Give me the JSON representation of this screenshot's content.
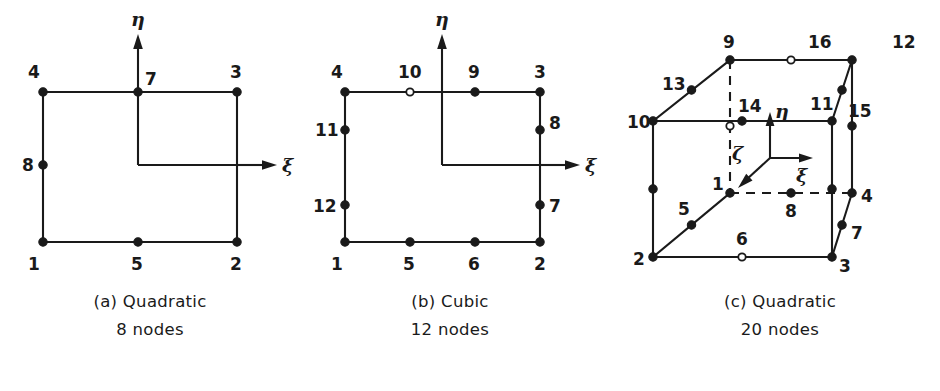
{
  "figure": {
    "panels": [
      {
        "id": "a",
        "caption_line1": "(a) Quadratic",
        "caption_line2": "8 nodes",
        "element_type": "Quadratic",
        "node_count": 8,
        "dimension": "2D",
        "axes": [
          {
            "name": "xi",
            "label": "ξ",
            "direction": "right"
          },
          {
            "name": "eta",
            "label": "η",
            "direction": "up"
          }
        ],
        "nodes": [
          {
            "id": "1",
            "label": "1",
            "marker": "filled",
            "position": "bottom-left-corner"
          },
          {
            "id": "2",
            "label": "2",
            "marker": "filled",
            "position": "bottom-right-corner"
          },
          {
            "id": "3",
            "label": "3",
            "marker": "filled",
            "position": "top-right-corner"
          },
          {
            "id": "4",
            "label": "4",
            "marker": "filled",
            "position": "top-left-corner"
          },
          {
            "id": "5",
            "label": "5",
            "marker": "filled",
            "position": "bottom-mid"
          },
          {
            "id": "7",
            "label": "7",
            "marker": "filled",
            "position": "top-mid"
          },
          {
            "id": "8",
            "label": "8",
            "marker": "filled",
            "position": "left-mid"
          }
        ]
      },
      {
        "id": "b",
        "caption_line1": "(b) Cubic",
        "caption_line2": "12 nodes",
        "element_type": "Cubic",
        "node_count": 12,
        "dimension": "2D",
        "axes": [
          {
            "name": "xi",
            "label": "ξ",
            "direction": "right"
          },
          {
            "name": "eta",
            "label": "η",
            "direction": "up"
          }
        ],
        "nodes": [
          {
            "id": "1",
            "label": "1",
            "marker": "filled",
            "position": "bottom-left-corner"
          },
          {
            "id": "2",
            "label": "2",
            "marker": "filled",
            "position": "bottom-right-corner"
          },
          {
            "id": "3",
            "label": "3",
            "marker": "filled",
            "position": "top-right-corner"
          },
          {
            "id": "4",
            "label": "4",
            "marker": "filled",
            "position": "top-left-corner"
          },
          {
            "id": "5",
            "label": "5",
            "marker": "filled",
            "position": "bottom-third-1"
          },
          {
            "id": "6",
            "label": "6",
            "marker": "filled",
            "position": "bottom-third-2"
          },
          {
            "id": "7",
            "label": "7",
            "marker": "filled",
            "position": "right-third-1"
          },
          {
            "id": "8",
            "label": "8",
            "marker": "filled",
            "position": "right-third-2"
          },
          {
            "id": "9",
            "label": "9",
            "marker": "filled",
            "position": "top-third-2"
          },
          {
            "id": "10",
            "label": "10",
            "marker": "open",
            "position": "top-third-1"
          },
          {
            "id": "11",
            "label": "11",
            "marker": "filled",
            "position": "left-third-2"
          },
          {
            "id": "12",
            "label": "12",
            "marker": "filled",
            "position": "left-third-1"
          }
        ]
      },
      {
        "id": "c",
        "caption_line1": "(c) Quadratic",
        "caption_line2": "20 nodes",
        "element_type": "Quadratic",
        "node_count": 20,
        "dimension": "3D",
        "axes": [
          {
            "name": "xi",
            "label": "ξ",
            "direction": "right"
          },
          {
            "name": "eta",
            "label": "η",
            "direction": "up"
          },
          {
            "name": "zeta",
            "label": "ζ",
            "direction": "down-left"
          }
        ],
        "nodes": [
          {
            "id": "1",
            "label": "1",
            "marker": "filled",
            "position": "bottom-back-left"
          },
          {
            "id": "2",
            "label": "2",
            "marker": "filled",
            "position": "bottom-front-left"
          },
          {
            "id": "3",
            "label": "3",
            "marker": "filled",
            "position": "bottom-front-right"
          },
          {
            "id": "4",
            "label": "4",
            "marker": "filled",
            "position": "bottom-back-right"
          },
          {
            "id": "5",
            "label": "5",
            "marker": "filled",
            "position": "bottom-left-diag-mid"
          },
          {
            "id": "6",
            "label": "6",
            "marker": "open",
            "position": "bottom-front-mid"
          },
          {
            "id": "7",
            "label": "7",
            "marker": "filled",
            "position": "bottom-right-diag-mid"
          },
          {
            "id": "8",
            "label": "8",
            "marker": "filled",
            "position": "bottom-back-mid"
          },
          {
            "id": "9",
            "label": "9",
            "marker": "filled",
            "position": "top-back-left"
          },
          {
            "id": "10",
            "label": "10",
            "marker": "filled",
            "position": "top-front-left"
          },
          {
            "id": "11",
            "label": "11",
            "marker": "filled",
            "position": "top-front-right"
          },
          {
            "id": "12",
            "label": "12",
            "marker": "filled",
            "position": "top-back-right"
          },
          {
            "id": "13",
            "label": "13",
            "marker": "filled",
            "position": "top-left-diag-mid"
          },
          {
            "id": "14",
            "label": "14",
            "marker": "filled",
            "position": "top-front-mid"
          },
          {
            "id": "15",
            "label": "15",
            "marker": "filled",
            "position": "top-right-diag-mid"
          },
          {
            "id": "16",
            "label": "16",
            "marker": "open",
            "position": "top-back-mid"
          }
        ]
      }
    ]
  },
  "style": {
    "line_color": "#1a1a1a",
    "background": "#ffffff"
  }
}
